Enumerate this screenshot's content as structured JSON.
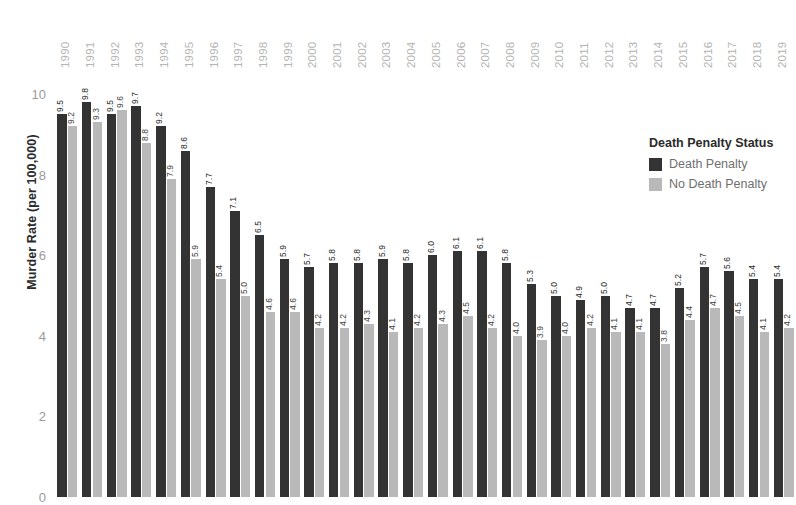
{
  "chart_data": {
    "type": "bar",
    "title": "",
    "xlabel": "",
    "ylabel": "Murder Rate (per 100,000)",
    "ylim": [
      0,
      10.6
    ],
    "yticks": [
      0,
      2,
      4,
      6,
      8,
      10
    ],
    "ytick_labels": [
      "0",
      "2",
      "4",
      "6",
      "8",
      "10"
    ],
    "grid": false,
    "legend_position": "right",
    "legend_title": "Death Penalty Status",
    "categories": [
      "1990",
      "1991",
      "1992",
      "1993",
      "1994",
      "1995",
      "1996",
      "1997",
      "1998",
      "1999",
      "2000",
      "2001",
      "2002",
      "2003",
      "2004",
      "2005",
      "2006",
      "2007",
      "2008",
      "2009",
      "2010",
      "2011",
      "2012",
      "2013",
      "2014",
      "2015",
      "2016",
      "2017",
      "2018",
      "2019"
    ],
    "series": [
      {
        "name": "Death Penalty",
        "color": "#333333",
        "values": [
          9.5,
          9.8,
          9.5,
          9.7,
          9.2,
          8.6,
          7.7,
          7.1,
          6.5,
          5.9,
          5.7,
          5.8,
          5.8,
          5.9,
          5.8,
          6.0,
          6.1,
          6.1,
          5.8,
          5.3,
          5.0,
          4.9,
          5.0,
          4.7,
          4.7,
          5.2,
          5.7,
          5.6,
          5.4,
          5.4
        ],
        "labels": [
          "9.5",
          "9.8",
          "9.5",
          "9.7",
          "9.2",
          "8.6",
          "7.7",
          "7.1",
          "6.5",
          "5.9",
          "5.7",
          "5.8",
          "5.8",
          "5.9",
          "5.8",
          "6.0",
          "6.1",
          "6.1",
          "5.8",
          "5.3",
          "5.0",
          "4.9",
          "5.0",
          "4.7",
          "4.7",
          "5.2",
          "5.7",
          "5.6",
          "5.4",
          "5.4"
        ]
      },
      {
        "name": "No Death Penalty",
        "color": "#b9b9b9",
        "values": [
          9.2,
          9.3,
          9.6,
          8.8,
          7.9,
          5.9,
          5.4,
          5.0,
          4.6,
          4.6,
          4.2,
          4.2,
          4.3,
          4.1,
          4.2,
          4.3,
          4.5,
          4.2,
          4.0,
          3.9,
          4.0,
          4.2,
          4.1,
          4.1,
          3.8,
          4.4,
          4.7,
          4.5,
          4.1,
          4.2
        ],
        "labels": [
          "9.2",
          "9.3",
          "9.6",
          "8.8",
          "7.9",
          "5.9",
          "5.4",
          "5.0",
          "4.6",
          "4.6",
          "4.2",
          "4.2",
          "4.3",
          "4.1",
          "4.2",
          "4.3",
          "4.5",
          "4.2",
          "4.0",
          "3.9",
          "4.0",
          "4.2",
          "4.1",
          "4.1",
          "3.8",
          "4.4",
          "4.7",
          "4.5",
          "4.1",
          "4.2"
        ]
      }
    ]
  },
  "legend": {
    "title": "Death Penalty Status",
    "items": [
      {
        "label": "Death Penalty",
        "color": "#333333"
      },
      {
        "label": "No Death Penalty",
        "color": "#b9b9b9"
      }
    ]
  },
  "axes": {
    "y_title": "Murder Rate (per 100,000)"
  }
}
